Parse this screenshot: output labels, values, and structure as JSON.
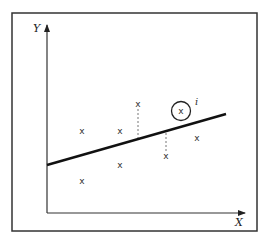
{
  "diagram": {
    "colors": {
      "frame": "#333333",
      "axis": "#333333",
      "line": "#111111",
      "point": "#333333",
      "residual": "#777777"
    },
    "axes": {
      "x_label": "X",
      "y_label": "Y",
      "origin": [
        47,
        213
      ],
      "x_end": 245,
      "y_end": 25
    },
    "regression_line": {
      "x1": 47,
      "y1": 165,
      "x2": 226,
      "y2": 114
    },
    "point_marker": "x",
    "points": [
      {
        "x": 82,
        "y": 131
      },
      {
        "x": 120,
        "y": 131
      },
      {
        "x": 82,
        "y": 181
      },
      {
        "x": 120,
        "y": 165
      },
      {
        "x": 138,
        "y": 104,
        "residual_to": 139
      },
      {
        "x": 166,
        "y": 156,
        "residual_to": 132
      },
      {
        "x": 181,
        "y": 111,
        "circled": true,
        "label": "i"
      },
      {
        "x": 197,
        "y": 138
      }
    ]
  }
}
